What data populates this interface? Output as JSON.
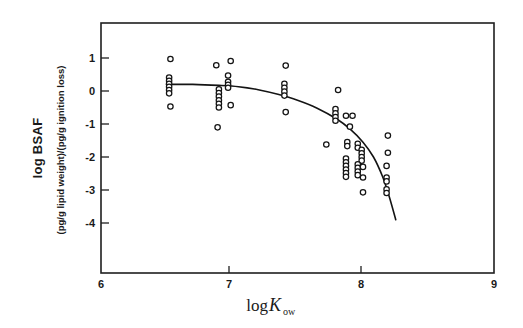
{
  "figure": {
    "background_color": "#ffffff",
    "ink_color": "#1a1a1a"
  },
  "chart_data": {
    "type": "scatter",
    "title": "",
    "subtitle": "",
    "xlabel": "log Kow",
    "xlabel_parts": {
      "prefix": "log ",
      "symbol": "K",
      "subscript": "ow"
    },
    "ylabel": "log BSAF",
    "ylabel_secondary": "(pg/g lipid weight)/(pg/g ignition loss)",
    "xlim": [
      6,
      9
    ],
    "ylim": [
      -4.6,
      1.6
    ],
    "xticks": [
      6,
      7,
      8,
      9
    ],
    "xtick_labels": [
      "6",
      "7",
      "8",
      "9"
    ],
    "yticks": [
      1,
      0,
      -1,
      -2,
      -3,
      -4
    ],
    "ytick_labels": [
      "1",
      "0",
      "-1",
      "-2",
      "-3",
      "-4"
    ],
    "grid": false,
    "legend": null,
    "marker": "open-circle",
    "points": [
      [
        6.53,
        0.97
      ],
      [
        6.52,
        0.41
      ],
      [
        6.52,
        0.31
      ],
      [
        6.52,
        0.22
      ],
      [
        6.52,
        0.13
      ],
      [
        6.52,
        0.03
      ],
      [
        6.52,
        -0.07
      ],
      [
        6.53,
        -0.47
      ],
      [
        6.88,
        0.78
      ],
      [
        6.99,
        0.91
      ],
      [
        6.97,
        0.47
      ],
      [
        6.97,
        0.28
      ],
      [
        6.97,
        0.19
      ],
      [
        6.97,
        0.1
      ],
      [
        6.9,
        0.05
      ],
      [
        6.9,
        -0.06
      ],
      [
        6.9,
        -0.17
      ],
      [
        6.9,
        -0.28
      ],
      [
        6.9,
        -0.39
      ],
      [
        6.9,
        -0.5
      ],
      [
        6.99,
        -0.43
      ],
      [
        6.89,
        -1.1
      ],
      [
        7.41,
        0.77
      ],
      [
        7.4,
        0.22
      ],
      [
        7.4,
        0.1
      ],
      [
        7.4,
        -0.02
      ],
      [
        7.4,
        -0.14
      ],
      [
        7.41,
        -0.64
      ],
      [
        7.81,
        0.03
      ],
      [
        7.79,
        -0.55
      ],
      [
        7.79,
        -0.68
      ],
      [
        7.79,
        -0.79
      ],
      [
        7.79,
        -0.9
      ],
      [
        7.87,
        -0.75
      ],
      [
        7.92,
        -0.75
      ],
      [
        7.9,
        -1.08
      ],
      [
        7.72,
        -1.62
      ],
      [
        7.88,
        -1.55
      ],
      [
        7.88,
        -1.67
      ],
      [
        7.96,
        -1.6
      ],
      [
        7.96,
        -1.72
      ],
      [
        7.99,
        -1.78
      ],
      [
        7.99,
        -1.89
      ],
      [
        7.99,
        -2.0
      ],
      [
        7.99,
        -2.11
      ],
      [
        7.87,
        -2.05
      ],
      [
        7.87,
        -2.16
      ],
      [
        7.87,
        -2.27
      ],
      [
        7.87,
        -2.38
      ],
      [
        7.87,
        -2.49
      ],
      [
        7.87,
        -2.6
      ],
      [
        7.96,
        -2.22
      ],
      [
        7.96,
        -2.33
      ],
      [
        7.96,
        -2.44
      ],
      [
        7.96,
        -2.55
      ],
      [
        8.0,
        -2.3
      ],
      [
        8.0,
        -2.62
      ],
      [
        8.0,
        -3.07
      ],
      [
        8.19,
        -1.35
      ],
      [
        8.19,
        -1.87
      ],
      [
        8.18,
        -2.27
      ],
      [
        8.18,
        -2.62
      ],
      [
        8.18,
        -2.74
      ],
      [
        8.18,
        -2.98
      ],
      [
        8.18,
        -3.09
      ]
    ],
    "fit_curve": {
      "description": "smooth declining regression curve",
      "points": [
        [
          6.5,
          0.2
        ],
        [
          6.7,
          0.2
        ],
        [
          6.9,
          0.17
        ],
        [
          7.05,
          0.13
        ],
        [
          7.2,
          0.04
        ],
        [
          7.35,
          -0.1
        ],
        [
          7.5,
          -0.28
        ],
        [
          7.65,
          -0.52
        ],
        [
          7.8,
          -0.85
        ],
        [
          7.9,
          -1.15
        ],
        [
          8.0,
          -1.55
        ],
        [
          8.08,
          -2.0
        ],
        [
          8.15,
          -2.6
        ],
        [
          8.2,
          -3.2
        ],
        [
          8.25,
          -3.9
        ]
      ]
    }
  }
}
